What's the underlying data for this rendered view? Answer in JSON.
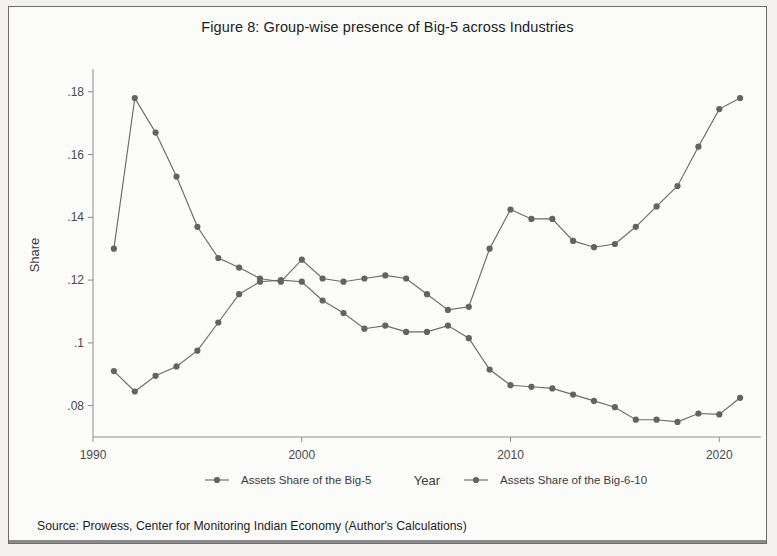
{
  "figure": {
    "title": "Figure 8: Group-wise presence of Big-5 across Industries",
    "source_note": "Source: Prowess, Center for Monitoring Indian Economy (Author's Calculations)"
  },
  "colors": {
    "series": "#6b6b6b",
    "marker": "#636363",
    "axis": "#8d8d8d",
    "text": "#3a3a3a",
    "background": "#fbfbfa",
    "page_background": "#f2f1ef",
    "frame_border": "#6d6d6d"
  },
  "chart_data": {
    "type": "line",
    "title": "Figure 8: Group-wise presence of Big-5 across Industries",
    "xlabel": "Year",
    "ylabel": "Share",
    "xlim": [
      1990,
      2022
    ],
    "ylim": [
      0.07,
      0.186
    ],
    "xticks": [
      1990,
      2000,
      2010,
      2020
    ],
    "xticklabels": [
      "1990",
      "2000",
      "2010",
      "2020"
    ],
    "yticks": [
      0.08,
      0.1,
      0.12,
      0.14,
      0.16,
      0.18
    ],
    "yticklabels": [
      ".08",
      ".1",
      ".12",
      ".14",
      ".16",
      ".18"
    ],
    "grid": false,
    "legend_position": "bottom",
    "markers": "circle",
    "x": [
      1991,
      1992,
      1993,
      1994,
      1995,
      1996,
      1997,
      1998,
      1999,
      2000,
      2001,
      2002,
      2003,
      2004,
      2005,
      2006,
      2007,
      2008,
      2009,
      2010,
      2011,
      2012,
      2013,
      2014,
      2015,
      2016,
      2017,
      2018,
      2019,
      2020,
      2021
    ],
    "series": [
      {
        "name": "Assets Share of the Big-5",
        "values": [
          0.13,
          0.178,
          0.167,
          0.153,
          0.137,
          0.127,
          0.124,
          0.1205,
          0.1195,
          0.1265,
          0.1205,
          0.1195,
          0.1205,
          0.1215,
          0.1205,
          0.1155,
          0.1105,
          0.1115,
          0.13,
          0.1425,
          0.1395,
          0.1395,
          0.1325,
          0.1305,
          0.1315,
          0.137,
          0.1435,
          0.15,
          0.1625,
          0.1745,
          0.178
        ]
      },
      {
        "name": "Assets Share of the Big-6-10",
        "values": [
          0.091,
          0.0845,
          0.0895,
          0.0925,
          0.0975,
          0.1065,
          0.1155,
          0.1195,
          0.12,
          0.1195,
          0.1135,
          0.1095,
          0.1045,
          0.1055,
          0.1035,
          0.1035,
          0.1055,
          0.1015,
          0.0915,
          0.0865,
          0.086,
          0.0855,
          0.0835,
          0.0815,
          0.0795,
          0.0755,
          0.0755,
          0.0748,
          0.0775,
          0.0772,
          0.0825
        ]
      }
    ]
  },
  "legend": {
    "items": [
      {
        "label": "Assets Share of the Big-5"
      },
      {
        "label": "Assets Share of the Big-6-10"
      }
    ]
  }
}
